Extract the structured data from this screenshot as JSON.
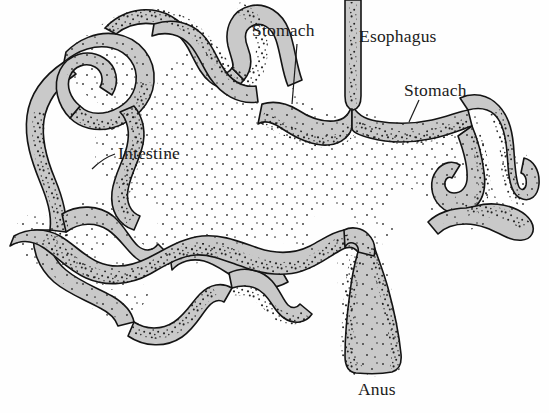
{
  "figure": {
    "kind": "anatomical-line-drawing",
    "background_color": "#fefefe",
    "organ_fill_color": "#c9c9c9",
    "organ_outline_color": "#141414",
    "stipple_color": "#1a1a1a",
    "label_color": "#1b1b1b",
    "width": 549,
    "height": 413
  },
  "labels": {
    "stomach_upper": "Stomach",
    "esophagus": "Esophagus",
    "stomach_right": "Stomach",
    "intestine": "Intestine",
    "anus": "Anus"
  },
  "leader_lines": {
    "stomach_upper": "vertical line from label down to stomach wall",
    "stomach_right": "short diagonal line from label down-left to stomach wall",
    "intestine": "curved line from label left to intestine wall",
    "anus": "none"
  },
  "parts": [
    {
      "name": "esophagus",
      "description": "narrow vertical tube entering from top edge"
    },
    {
      "name": "stomach",
      "description": "wide horizontal sac at upper centre and right"
    },
    {
      "name": "intestine",
      "description": "long convoluted coiled tube filling most of the field"
    },
    {
      "name": "rectum-anus",
      "description": "teardrop shaped terminal chamber at bottom centre"
    }
  ]
}
